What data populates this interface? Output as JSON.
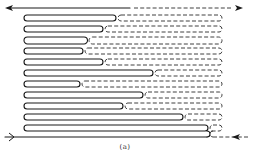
{
  "figure": {
    "caption": "(a)",
    "colors": {
      "line": "#1a1a1a",
      "background": "#ffffff"
    },
    "top_line": {
      "y": 8,
      "solid_from": 21,
      "solid_to": 130,
      "dashed_to": 232,
      "arrow_left_x": 5,
      "arrow_right_x": 243
    },
    "bottom_line": {
      "y": 137,
      "solid_from": 5,
      "solid_to": 207,
      "dashed_from": 213,
      "dashed_to": 250,
      "arrow_left_x": 14,
      "arrow_right_x": 232
    },
    "left_turn_x": 24,
    "right_turn_x": 222,
    "loops": [
      {
        "y_top": 15,
        "y_bottom": 21,
        "solid_end": 113
      },
      {
        "y_top": 26,
        "y_bottom": 32,
        "solid_end": 100
      },
      {
        "y_top": 37,
        "y_bottom": 44,
        "solid_end": 84
      },
      {
        "y_top": 48,
        "y_bottom": 54,
        "solid_end": 80
      },
      {
        "y_top": 59,
        "y_bottom": 65,
        "solid_end": 100
      },
      {
        "y_top": 70,
        "y_bottom": 76,
        "solid_end": 150
      },
      {
        "y_top": 81,
        "y_bottom": 87,
        "solid_end": 77
      },
      {
        "y_top": 92,
        "y_bottom": 98,
        "solid_end": 140
      },
      {
        "y_top": 103,
        "y_bottom": 109,
        "solid_end": 120
      },
      {
        "y_top": 114,
        "y_bottom": 120,
        "solid_end": 180
      },
      {
        "y_top": 125,
        "y_bottom": 131,
        "solid_end": 205
      }
    ],
    "paths": [
      {
        "name": "solid-meander",
        "style": "solid",
        "entry": "bottom-left",
        "exit": "top-left"
      },
      {
        "name": "dashed-meander",
        "style": "dashed",
        "entry": "bottom-right",
        "exit": "top-right"
      }
    ]
  }
}
